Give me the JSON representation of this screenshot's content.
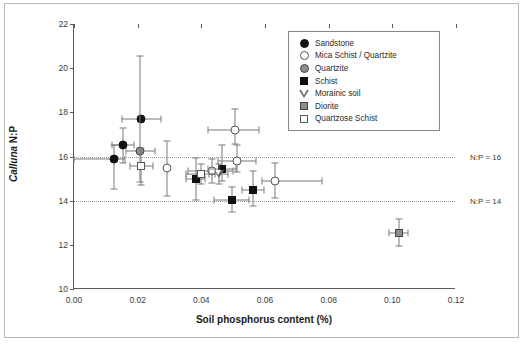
{
  "chart_data": {
    "type": "scatter",
    "title": "",
    "xlabel": "Soil phosphorus content (%)",
    "ylabel_italic": "Calluna",
    "ylabel_rest": " N:P",
    "xlim": [
      0.0,
      0.12
    ],
    "ylim": [
      10,
      22
    ],
    "xticks": [
      "0.00",
      "0.02",
      "0.04",
      "0.06",
      "0.08",
      "0.10",
      "0.12"
    ],
    "xtick_values": [
      0.0,
      0.02,
      0.04,
      0.06,
      0.08,
      0.1,
      0.12
    ],
    "yticks": [
      "10",
      "12",
      "14",
      "16",
      "18",
      "20",
      "22"
    ],
    "ytick_values": [
      10,
      12,
      14,
      16,
      18,
      20,
      22
    ],
    "grid": "horizontal-reference-lines-only",
    "legend_position": "top-right-inside",
    "reference_lines": [
      {
        "name": "np16",
        "y": 16,
        "label": "N:P = 16",
        "style": "dotted"
      },
      {
        "name": "np14",
        "y": 14,
        "label": "N:P = 14",
        "style": "dotted"
      }
    ],
    "series": [
      {
        "name": "Sandstone",
        "marker": "circle-filled",
        "points": [
          {
            "x": 0.0125,
            "y": 15.9,
            "xerr_lo": 0.0125,
            "xerr_hi": 0.0035,
            "yerr_lo": 1.35,
            "yerr_hi": 0.6
          },
          {
            "x": 0.0155,
            "y": 16.5,
            "xerr_lo": 0.0035,
            "xerr_hi": 0.0035,
            "yerr_lo": 0.8,
            "yerr_hi": 0.8
          },
          {
            "x": 0.0212,
            "y": 17.7,
            "xerr_lo": 0.006,
            "xerr_hi": 0.006,
            "yerr_lo": 0.0,
            "yerr_hi": 0.0
          }
        ]
      },
      {
        "name": "Mica Schist / Quartzite",
        "marker": "circle-open",
        "points": [
          {
            "x": 0.0292,
            "y": 15.5,
            "xerr_lo": 0.0,
            "xerr_hi": 0.0,
            "yerr_lo": 1.3,
            "yerr_hi": 1.2
          },
          {
            "x": 0.0433,
            "y": 15.35,
            "xerr_lo": 0.0075,
            "xerr_hi": 0.0065,
            "yerr_lo": 0.55,
            "yerr_hi": 0.55
          },
          {
            "x": 0.0505,
            "y": 17.2,
            "xerr_lo": 0.0085,
            "xerr_hi": 0.0075,
            "yerr_lo": 0.65,
            "yerr_hi": 0.95
          },
          {
            "x": 0.0512,
            "y": 15.8,
            "xerr_lo": 0.006,
            "xerr_hi": 0.006,
            "yerr_lo": 0.5,
            "yerr_hi": 0.7
          },
          {
            "x": 0.063,
            "y": 14.9,
            "xerr_lo": 0.004,
            "xerr_hi": 0.015,
            "yerr_lo": 0.8,
            "yerr_hi": 0.8
          }
        ]
      },
      {
        "name": "Quartzite",
        "marker": "circle-gray",
        "points": [
          {
            "x": 0.0208,
            "y": 16.25,
            "xerr_lo": 0.0045,
            "xerr_hi": 0.0045,
            "yerr_lo": 1.4,
            "yerr_hi": 4.3
          }
        ]
      },
      {
        "name": "Schist",
        "marker": "square-filled",
        "points": [
          {
            "x": 0.0382,
            "y": 15.0,
            "xerr_lo": 0.003,
            "xerr_hi": 0.003,
            "yerr_lo": 0.95,
            "yerr_hi": 0.95
          },
          {
            "x": 0.0465,
            "y": 15.45,
            "xerr_lo": 0.0045,
            "xerr_hi": 0.0045,
            "yerr_lo": 0.55,
            "yerr_hi": 1.05
          },
          {
            "x": 0.0496,
            "y": 14.05,
            "xerr_lo": 0.0055,
            "xerr_hi": 0.0055,
            "yerr_lo": 0.55,
            "yerr_hi": 0.55
          },
          {
            "x": 0.0562,
            "y": 14.5,
            "xerr_lo": 0.0035,
            "xerr_hi": 0.0035,
            "yerr_lo": 0.75,
            "yerr_hi": 0.85
          }
        ]
      },
      {
        "name": "Morainic soil",
        "marker": "triangle-open",
        "points": [
          {
            "x": 0.0455,
            "y": 15.2,
            "xerr_lo": 0.003,
            "xerr_hi": 0.003,
            "yerr_lo": 0.45,
            "yerr_hi": 0.45
          }
        ]
      },
      {
        "name": "Diorite",
        "marker": "square-gray",
        "points": [
          {
            "x": 0.102,
            "y": 12.55,
            "xerr_lo": 0.003,
            "xerr_hi": 0.003,
            "yerr_lo": 0.6,
            "yerr_hi": 0.6
          }
        ]
      },
      {
        "name": "Quartzose Schist",
        "marker": "square-open",
        "points": [
          {
            "x": 0.0212,
            "y": 15.55,
            "xerr_lo": 0.0035,
            "xerr_hi": 0.0035,
            "yerr_lo": 0.85,
            "yerr_hi": 0.85
          },
          {
            "x": 0.0398,
            "y": 15.2,
            "xerr_lo": 0.0045,
            "xerr_hi": 0.0045,
            "yerr_lo": 0.45,
            "yerr_hi": 0.45
          }
        ]
      }
    ]
  }
}
